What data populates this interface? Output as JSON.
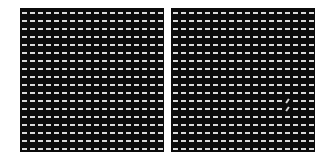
{
  "figure": {
    "background": "#ffffff",
    "panel_color": "#0b0b0b",
    "dash_color": "#d9d9d9",
    "panels": [
      {
        "id": "left",
        "left": 20,
        "grid": {
          "cols": 18,
          "rows": 18,
          "dx": 8,
          "dy": 8,
          "x0": 2,
          "y0": 4,
          "dash_w": 5,
          "dash_h": 2
        },
        "tilted": []
      },
      {
        "id": "right",
        "left": 171,
        "grid": {
          "cols": 18,
          "rows": 18,
          "dx": 8,
          "dy": 8,
          "x0": 2,
          "y0": 4,
          "dash_w": 5,
          "dash_h": 2
        },
        "tilted": [
          {
            "col": 14,
            "row": 11,
            "angle": -55
          },
          {
            "col": 14,
            "row": 12,
            "angle": -55
          }
        ]
      }
    ]
  }
}
